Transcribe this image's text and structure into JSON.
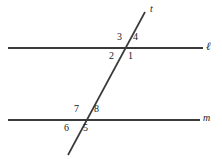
{
  "figure": {
    "type": "geometry-diagram",
    "background_color": "#ffffff",
    "stroke_color": "#3a3a3a",
    "text_color": "#1b1b1b"
  },
  "lines": [
    {
      "id": "line-l",
      "label": "ℓ",
      "kind": "parallel-line",
      "x1": 8,
      "y1": 48,
      "x2": 203,
      "y2": 48,
      "label_x": 206,
      "label_y": 42
    },
    {
      "id": "line-m",
      "label": "m",
      "kind": "parallel-line",
      "x1": 8,
      "y1": 120,
      "x2": 200,
      "y2": 120,
      "label_x": 203,
      "label_y": 114
    },
    {
      "id": "line-t",
      "label": "t",
      "kind": "transversal",
      "x1": 145,
      "y1": 12,
      "x2": 68,
      "y2": 155,
      "label_x": 150,
      "label_y": 5
    }
  ],
  "intersections": [
    {
      "id": "intersection-top",
      "line": "ℓ",
      "x": 128,
      "y": 48
    },
    {
      "id": "intersection-bottom",
      "line": "m",
      "x": 84,
      "y": 120
    }
  ],
  "angles": [
    {
      "id": "angle-3",
      "label": "3",
      "x": 117,
      "y": 33,
      "position": "upper-left",
      "intersection": "intersection-top"
    },
    {
      "id": "angle-4",
      "label": "4",
      "x": 133,
      "y": 33,
      "position": "upper-right",
      "intersection": "intersection-top"
    },
    {
      "id": "angle-2",
      "label": "2",
      "x": 109,
      "y": 52,
      "position": "lower-left",
      "intersection": "intersection-top"
    },
    {
      "id": "angle-1",
      "label": "1",
      "x": 128,
      "y": 52,
      "position": "lower-right",
      "intersection": "intersection-top"
    },
    {
      "id": "angle-7",
      "label": "7",
      "x": 74,
      "y": 105,
      "position": "upper-left",
      "intersection": "intersection-bottom"
    },
    {
      "id": "angle-8",
      "label": "8",
      "x": 94,
      "y": 105,
      "position": "upper-right",
      "intersection": "intersection-bottom"
    },
    {
      "id": "angle-6",
      "label": "6",
      "x": 64,
      "y": 124,
      "position": "lower-left",
      "intersection": "intersection-bottom"
    },
    {
      "id": "angle-5",
      "label": "5",
      "x": 83,
      "y": 124,
      "position": "lower-right",
      "intersection": "intersection-bottom"
    }
  ]
}
